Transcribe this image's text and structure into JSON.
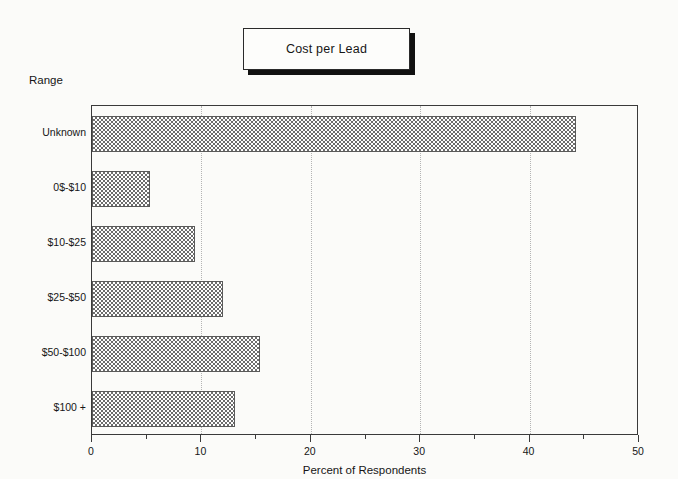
{
  "title": {
    "text": "Cost per Lead"
  },
  "axes": {
    "y_group_label": "Range",
    "x_title": "Percent of Respondents",
    "x_ticks": [
      "0",
      "10",
      "20",
      "30",
      "40",
      "50"
    ]
  },
  "chart_data": {
    "type": "bar",
    "orientation": "horizontal",
    "title": "Cost per Lead",
    "xlabel": "Percent of Respondents",
    "ylabel": "Range",
    "categories": [
      "Unknown",
      "0$-$10",
      "$10-$25",
      "$25-$50",
      "$50-$100",
      "$100 +"
    ],
    "values": [
      44.2,
      5.3,
      9.4,
      12.0,
      15.4,
      13.1
    ],
    "xlim": [
      0,
      50
    ],
    "xticks": [
      0,
      10,
      20,
      30,
      40,
      50
    ],
    "minor_xticks": [
      5,
      15,
      25,
      35,
      45
    ],
    "grid": "vertical-dotted-at-major-ticks",
    "legend": "none",
    "bar_fill": "#6d6d6d",
    "bar_pattern": "checkerboard-crosshatch",
    "bar_edge": "#5a5a5a"
  },
  "colors": {
    "background": "#fbfbf9",
    "text": "#161616",
    "axis": "#3a3a3a",
    "gridline": "#b4b4b4",
    "title_box_shadow": "#111111"
  }
}
